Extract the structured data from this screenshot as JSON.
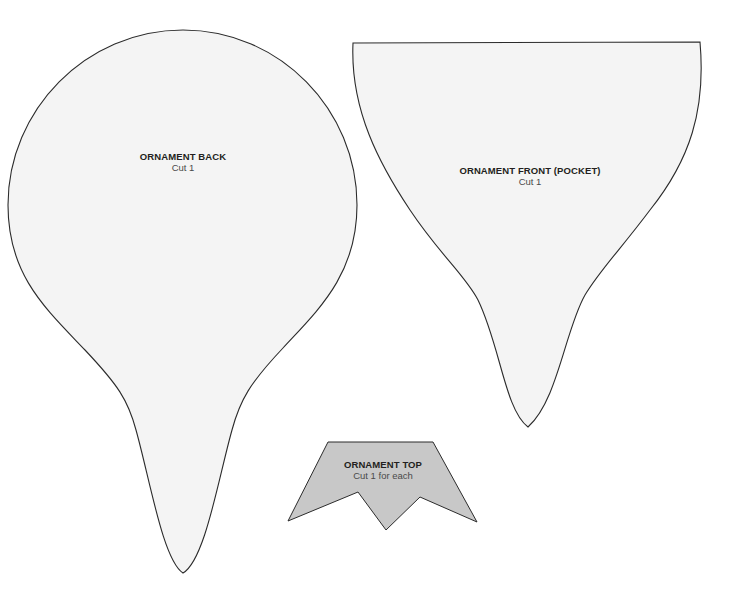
{
  "pieces": [
    {
      "id": "ornament-back",
      "title": "ORNAMENT BACK",
      "instruction": "Cut 1",
      "fill": "#f4f4f4",
      "stroke": "#2b2b2b"
    },
    {
      "id": "ornament-front",
      "title": "ORNAMENT FRONT (POCKET)",
      "instruction": "Cut 1",
      "fill": "#f4f4f4",
      "stroke": "#2b2b2b"
    },
    {
      "id": "ornament-top",
      "title": "ORNAMENT TOP",
      "instruction": "Cut 1 for each",
      "fill": "#c8c8c8",
      "stroke": "#2b2b2b"
    }
  ]
}
